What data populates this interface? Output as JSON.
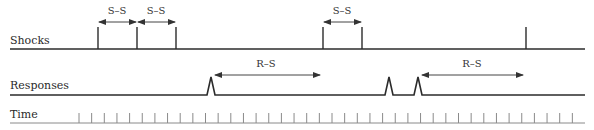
{
  "diagram": {
    "rows": {
      "shocks": {
        "label": "Shocks",
        "baseline_y": 49,
        "spike_top_y": 27,
        "x_start": 10,
        "x_end": 585,
        "events_x": [
          98,
          137,
          176,
          323,
          362,
          526
        ]
      },
      "responses": {
        "label": "Responses",
        "baseline_y": 95,
        "peak_y": 77,
        "x_start": 10,
        "x_end": 585,
        "events_x": [
          211,
          389,
          418
        ]
      },
      "time": {
        "label": "Time",
        "baseline_y": 123,
        "tick_top_y": 113,
        "x_start": 10,
        "x_end": 585,
        "tick_start_x": 79,
        "tick_spacing": 12.65,
        "tick_count": 40
      }
    },
    "intervals": [
      {
        "label": "S–S",
        "x1": 98,
        "x2": 137,
        "y": 22,
        "label_x": 117,
        "label_y": 14
      },
      {
        "label": "S–S",
        "x1": 137,
        "x2": 176,
        "y": 22,
        "label_x": 156,
        "label_y": 14
      },
      {
        "label": "S–S",
        "x1": 323,
        "x2": 362,
        "y": 22,
        "label_x": 342,
        "label_y": 14
      },
      {
        "label": "R–S",
        "x1": 214,
        "x2": 321,
        "y": 75,
        "label_x": 266,
        "label_y": 67
      },
      {
        "label": "R–S",
        "x1": 421,
        "x2": 524,
        "y": 75,
        "label_x": 472,
        "label_y": 67
      }
    ],
    "colors": {
      "line": "#2b2b2b",
      "time_line": "#8a8a8a",
      "arrow": "#444444"
    }
  }
}
